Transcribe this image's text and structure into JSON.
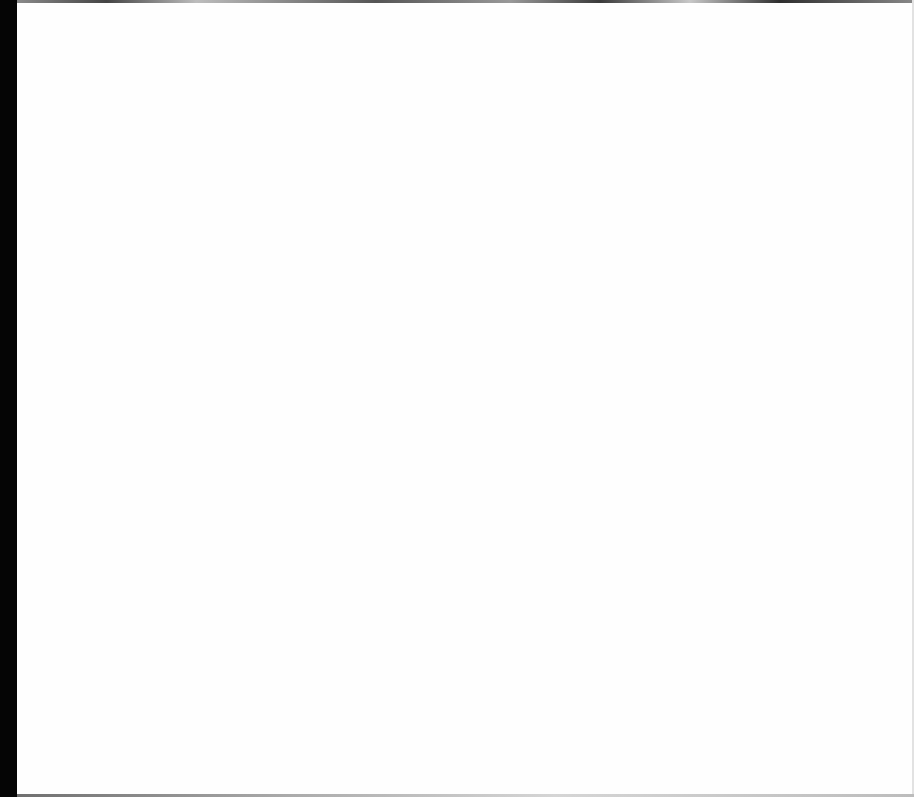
{
  "page": {
    "colors": {
      "background": "#ffffff",
      "left_strip": "#050505",
      "edge": "#8a8a8a"
    }
  }
}
